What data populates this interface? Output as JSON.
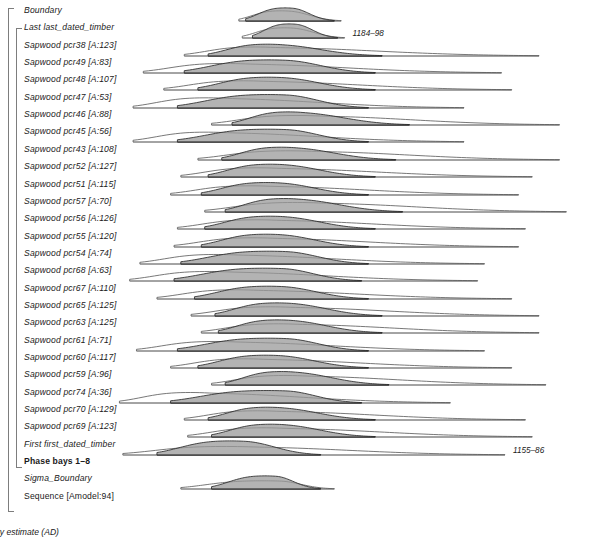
{
  "figure": {
    "axis_title": "posterior density estimate (AD)",
    "x_min": 1132,
    "x_max": 1268,
    "x_major_ticks": [
      1150,
      1175,
      1200,
      1225,
      1250
    ],
    "x_minor_step": 5,
    "fill_color": "#9a9a9a",
    "line_color": "#2b2b2b",
    "bracket_color": "#7d7d7d"
  },
  "chart_data": {
    "type": "area",
    "title": "",
    "xlabel": "posterior density estimate (AD)",
    "ylabel": "",
    "xlim": [
      1132,
      1268
    ],
    "grid": false,
    "legend": "none",
    "rows": [
      {
        "label": "Boundary",
        "style": "italic",
        "group": "sequence",
        "prior": {
          "start": 1168,
          "end": 1198,
          "mode": 1183,
          "height": 0.62
        },
        "posterior": {
          "start": 1170,
          "end": 1196,
          "mode": 1184,
          "height": 0.8
        },
        "annotation": null
      },
      {
        "label": "Last last_dated_timber",
        "style": "italic",
        "group": "phase",
        "prior": {
          "start": 1169,
          "end": 1199,
          "mode": 1184,
          "height": 0.62
        },
        "posterior": {
          "start": 1172,
          "end": 1197,
          "mode": 1185,
          "height": 0.86
        },
        "annotation": "1184–98"
      },
      {
        "label": "Sapwood pcr38 [A:123]",
        "style": "italic",
        "group": "phase",
        "prior": {
          "start": 1152,
          "end": 1256,
          "mode": 1177,
          "height": 0.55
        },
        "posterior": {
          "start": 1159,
          "end": 1210,
          "mode": 1180,
          "height": 0.72
        },
        "annotation": null
      },
      {
        "label": "Sapwood pcr49 [A:83]",
        "style": "italic",
        "group": "phase",
        "prior": {
          "start": 1140,
          "end": 1245,
          "mode": 1169,
          "height": 0.58
        },
        "posterior": {
          "start": 1152,
          "end": 1208,
          "mode": 1182,
          "height": 0.8
        },
        "annotation": null
      },
      {
        "label": "Sapwood pcr48 [A:107]",
        "style": "italic",
        "group": "phase",
        "prior": {
          "start": 1146,
          "end": 1248,
          "mode": 1174,
          "height": 0.56
        },
        "posterior": {
          "start": 1156,
          "end": 1208,
          "mode": 1181,
          "height": 0.78
        },
        "annotation": null
      },
      {
        "label": "Sapwood pcr47 [A:53]",
        "style": "italic",
        "group": "phase",
        "prior": {
          "start": 1137,
          "end": 1234,
          "mode": 1163,
          "height": 0.62
        },
        "posterior": {
          "start": 1150,
          "end": 1206,
          "mode": 1182,
          "height": 0.82
        },
        "annotation": null
      },
      {
        "label": "Sapwood pcr46 [A:88]",
        "style": "italic",
        "group": "phase",
        "prior": {
          "start": 1160,
          "end": 1262,
          "mode": 1190,
          "height": 0.58
        },
        "posterior": {
          "start": 1166,
          "end": 1218,
          "mode": 1186,
          "height": 0.8
        },
        "annotation": null
      },
      {
        "label": "Sapwood pcr45 [A:56]",
        "style": "italic",
        "group": "phase",
        "prior": {
          "start": 1137,
          "end": 1234,
          "mode": 1163,
          "height": 0.6
        },
        "posterior": {
          "start": 1150,
          "end": 1206,
          "mode": 1182,
          "height": 0.78
        },
        "annotation": null
      },
      {
        "label": "Sapwood pcr43 [A:108]",
        "style": "italic",
        "group": "phase",
        "prior": {
          "start": 1156,
          "end": 1262,
          "mode": 1188,
          "height": 0.56
        },
        "posterior": {
          "start": 1163,
          "end": 1214,
          "mode": 1184,
          "height": 0.78
        },
        "annotation": null
      },
      {
        "label": "Sapwood pcr52 [A:127]",
        "style": "italic",
        "group": "phase",
        "prior": {
          "start": 1151,
          "end": 1254,
          "mode": 1178,
          "height": 0.56
        },
        "posterior": {
          "start": 1159,
          "end": 1208,
          "mode": 1181,
          "height": 0.78
        },
        "annotation": null
      },
      {
        "label": "Sapwood pcr51 [A:115]",
        "style": "italic",
        "group": "phase",
        "prior": {
          "start": 1148,
          "end": 1250,
          "mode": 1176,
          "height": 0.56
        },
        "posterior": {
          "start": 1157,
          "end": 1206,
          "mode": 1180,
          "height": 0.76
        },
        "annotation": null
      },
      {
        "label": "Sapwood pcr57 [A:70]",
        "style": "italic",
        "group": "phase",
        "prior": {
          "start": 1158,
          "end": 1264,
          "mode": 1190,
          "height": 0.58
        },
        "posterior": {
          "start": 1164,
          "end": 1216,
          "mode": 1185,
          "height": 0.82
        },
        "annotation": null
      },
      {
        "label": "Sapwood pcr56 [A:126]",
        "style": "italic",
        "group": "phase",
        "prior": {
          "start": 1150,
          "end": 1252,
          "mode": 1178,
          "height": 0.56
        },
        "posterior": {
          "start": 1158,
          "end": 1208,
          "mode": 1181,
          "height": 0.78
        },
        "annotation": null
      },
      {
        "label": "Sapwood pcr55 [A:120]",
        "style": "italic",
        "group": "phase",
        "prior": {
          "start": 1149,
          "end": 1250,
          "mode": 1177,
          "height": 0.56
        },
        "posterior": {
          "start": 1157,
          "end": 1206,
          "mode": 1180,
          "height": 0.78
        },
        "annotation": null
      },
      {
        "label": "Sapwood pcr54 [A:74]",
        "style": "italic",
        "group": "phase",
        "prior": {
          "start": 1139,
          "end": 1240,
          "mode": 1166,
          "height": 0.58
        },
        "posterior": {
          "start": 1151,
          "end": 1206,
          "mode": 1182,
          "height": 0.78
        },
        "annotation": null
      },
      {
        "label": "Sapwood pcr68 [A:63]",
        "style": "italic",
        "group": "phase",
        "prior": {
          "start": 1136,
          "end": 1238,
          "mode": 1164,
          "height": 0.58
        },
        "posterior": {
          "start": 1149,
          "end": 1204,
          "mode": 1181,
          "height": 0.78
        },
        "annotation": null
      },
      {
        "label": "Sapwood pcr67 [A:110]",
        "style": "italic",
        "group": "phase",
        "prior": {
          "start": 1144,
          "end": 1248,
          "mode": 1172,
          "height": 0.56
        },
        "posterior": {
          "start": 1155,
          "end": 1206,
          "mode": 1181,
          "height": 0.78
        },
        "annotation": null
      },
      {
        "label": "Sapwood pcr65 [A:125]",
        "style": "italic",
        "group": "phase",
        "prior": {
          "start": 1154,
          "end": 1256,
          "mode": 1182,
          "height": 0.56
        },
        "posterior": {
          "start": 1161,
          "end": 1210,
          "mode": 1183,
          "height": 0.8
        },
        "annotation": null
      },
      {
        "label": "Sapwood pcr63 [A:125]",
        "style": "italic",
        "group": "phase",
        "prior": {
          "start": 1157,
          "end": 1256,
          "mode": 1184,
          "height": 0.56
        },
        "posterior": {
          "start": 1162,
          "end": 1210,
          "mode": 1183,
          "height": 0.8
        },
        "annotation": null
      },
      {
        "label": "Sapwood pcr61 [A:71]",
        "style": "italic",
        "group": "phase",
        "prior": {
          "start": 1138,
          "end": 1240,
          "mode": 1166,
          "height": 0.58
        },
        "posterior": {
          "start": 1150,
          "end": 1206,
          "mode": 1182,
          "height": 0.78
        },
        "annotation": null
      },
      {
        "label": "Sapwood pcr60 [A:117]",
        "style": "italic",
        "group": "phase",
        "prior": {
          "start": 1148,
          "end": 1248,
          "mode": 1174,
          "height": 0.56
        },
        "posterior": {
          "start": 1156,
          "end": 1206,
          "mode": 1180,
          "height": 0.78
        },
        "annotation": null
      },
      {
        "label": "Sapwood pcr59 [A:96]",
        "style": "italic",
        "group": "phase",
        "prior": {
          "start": 1160,
          "end": 1258,
          "mode": 1186,
          "height": 0.58
        },
        "posterior": {
          "start": 1164,
          "end": 1212,
          "mode": 1184,
          "height": 0.82
        },
        "annotation": null
      },
      {
        "label": "Sapwood pcr74 [A:36]",
        "style": "italic",
        "group": "phase",
        "prior": {
          "start": 1133,
          "end": 1230,
          "mode": 1158,
          "height": 0.64
        },
        "posterior": {
          "start": 1148,
          "end": 1204,
          "mode": 1182,
          "height": 0.76
        },
        "annotation": null
      },
      {
        "label": "Sapwood pcr70 [A:129]",
        "style": "italic",
        "group": "phase",
        "prior": {
          "start": 1152,
          "end": 1252,
          "mode": 1178,
          "height": 0.56
        },
        "posterior": {
          "start": 1159,
          "end": 1208,
          "mode": 1180,
          "height": 0.78
        },
        "annotation": null
      },
      {
        "label": "Sapwood pcr69 [A:123]",
        "style": "italic",
        "group": "phase",
        "prior": {
          "start": 1153,
          "end": 1254,
          "mode": 1180,
          "height": 0.56
        },
        "posterior": {
          "start": 1160,
          "end": 1208,
          "mode": 1181,
          "height": 0.78
        },
        "annotation": null
      },
      {
        "label": "First first_dated_timber",
        "style": "italic",
        "group": "phase",
        "prior": {
          "start": 1134,
          "end": 1246,
          "mode": 1170,
          "height": 0.52
        },
        "posterior": {
          "start": 1144,
          "end": 1192,
          "mode": 1170,
          "height": 0.86
        },
        "annotation": "1155–86"
      },
      {
        "label": "Phase bays 1–8",
        "style": "bold",
        "group": "phase-end",
        "prior": null,
        "posterior": null,
        "annotation": null
      },
      {
        "label": "Sigma_Boundary",
        "style": "italic",
        "group": "sequence",
        "prior": {
          "start": 1151,
          "end": 1196,
          "mode": 1180,
          "height": 0.5
        },
        "posterior": {
          "start": 1160,
          "end": 1192,
          "mode": 1179,
          "height": 0.8
        },
        "annotation": null
      },
      {
        "label": "Sequence [Amodel:94]",
        "style": "plain",
        "group": "sequence-end",
        "prior": null,
        "posterior": null,
        "annotation": null
      }
    ]
  },
  "brackets": [
    {
      "name": "sequence-bracket",
      "x": 8,
      "y_top": 8,
      "y_bottom": 512,
      "width": 6
    },
    {
      "name": "phase-bracket",
      "x": 16,
      "y_top": 28,
      "y_bottom": 468,
      "width": 6
    }
  ]
}
